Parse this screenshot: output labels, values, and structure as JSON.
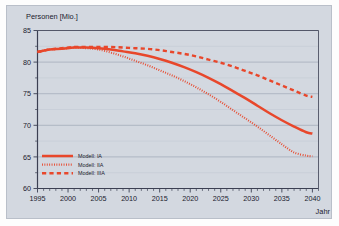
{
  "chart_data": {
    "type": "line",
    "title": "",
    "ylabel": "Personen [Mio.]",
    "xlabel": "Jahr",
    "xlim": [
      1995,
      2041
    ],
    "ylim": [
      60,
      85
    ],
    "grid": true,
    "legend_position": "bottom-left",
    "x_ticks": [
      1995,
      2000,
      2005,
      2010,
      2015,
      2020,
      2025,
      2030,
      2035,
      2040
    ],
    "y_ticks": [
      60,
      65,
      70,
      75,
      80,
      85
    ],
    "x_tick_labels": [
      "1995",
      "2000",
      "2005",
      "2010",
      "2015",
      "2020",
      "2025",
      "2030",
      "2035",
      "2040"
    ],
    "y_tick_labels": [
      "60",
      "65",
      "70",
      "75",
      "80",
      "85"
    ],
    "x_minor_step": 1,
    "y_minor_step": 2.5,
    "series": [
      {
        "name": "Modell: IA",
        "style": "solid",
        "color": "#e8472b",
        "x": [
          1995,
          1997,
          1999,
          2001,
          2003,
          2005,
          2007,
          2009,
          2011,
          2013,
          2015,
          2017,
          2019,
          2021,
          2023,
          2025,
          2027,
          2029,
          2031,
          2033,
          2035,
          2037,
          2039,
          2040
        ],
        "values": [
          81.6,
          82.0,
          82.1,
          82.3,
          82.3,
          82.2,
          82.0,
          81.7,
          81.4,
          81.0,
          80.5,
          79.9,
          79.2,
          78.4,
          77.5,
          76.5,
          75.4,
          74.3,
          73.1,
          71.9,
          70.8,
          69.8,
          68.9,
          68.7
        ]
      },
      {
        "name": "Modell: IIA",
        "style": "dotted",
        "color": "#e8472b",
        "x": [
          1995,
          1997,
          1999,
          2001,
          2003,
          2005,
          2007,
          2009,
          2011,
          2013,
          2015,
          2017,
          2019,
          2021,
          2023,
          2025,
          2027,
          2029,
          2031,
          2033,
          2035,
          2037,
          2039,
          2040
        ],
        "values": [
          81.6,
          82.0,
          82.1,
          82.3,
          82.2,
          82.0,
          81.5,
          80.9,
          80.2,
          79.5,
          78.7,
          77.9,
          77.0,
          76.0,
          74.9,
          73.7,
          72.4,
          71.1,
          69.8,
          68.4,
          67.0,
          65.7,
          65.2,
          65.1
        ]
      },
      {
        "name": "Modell: IIIA",
        "style": "dashed",
        "color": "#e8472b",
        "x": [
          1995,
          1997,
          1999,
          2001,
          2003,
          2005,
          2007,
          2009,
          2011,
          2013,
          2015,
          2017,
          2019,
          2021,
          2023,
          2025,
          2027,
          2029,
          2031,
          2033,
          2035,
          2037,
          2039,
          2040
        ],
        "values": [
          81.6,
          82.0,
          82.2,
          82.4,
          82.4,
          82.4,
          82.4,
          82.3,
          82.2,
          82.1,
          81.9,
          81.6,
          81.3,
          80.9,
          80.4,
          79.9,
          79.3,
          78.6,
          77.9,
          77.1,
          76.3,
          75.5,
          74.7,
          74.5
        ]
      }
    ]
  },
  "legend": {
    "items": [
      {
        "label": "Modell: IA",
        "style": "solid"
      },
      {
        "label": "Modell: IIA",
        "style": "dotted"
      },
      {
        "label": "Modell: IIIA",
        "style": "dashed"
      }
    ]
  },
  "colors": {
    "series": "#e8472b",
    "plot_background": "#d3d8e0",
    "axis": "#3b3f52",
    "grid_major": "#9fa7b6",
    "grid_minor": "#c3c9d4",
    "text": "#1a1a2e"
  }
}
